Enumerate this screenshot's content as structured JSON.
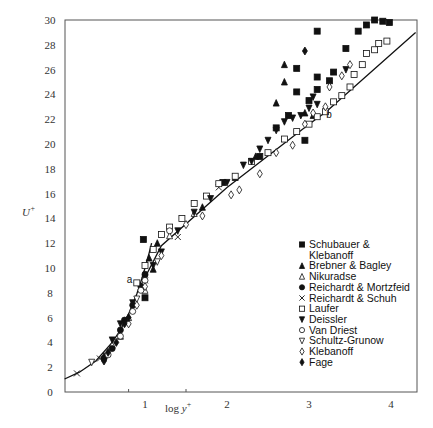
{
  "chart_data": {
    "type": "scatter",
    "title": "",
    "xlabel": "log y+",
    "ylabel": "U+",
    "xlim": [
      0,
      4.3
    ],
    "ylim": [
      0,
      30
    ],
    "xticks": [
      "1",
      "2",
      "3",
      "4"
    ],
    "yticks": [
      "0",
      "2",
      "4",
      "6",
      "8",
      "10",
      "12",
      "14",
      "16",
      "18",
      "20",
      "22",
      "24",
      "26",
      "28",
      "30"
    ],
    "grid": false,
    "legend_position": "lower right inside",
    "annotations": [
      {
        "text": "a",
        "x": 0.9,
        "y": 9.0
      },
      {
        "text": "b",
        "x": 3.21,
        "y": 22.3
      }
    ],
    "curves": [
      {
        "name": "viscous sublayer (U+ = y+)",
        "points": [
          [
            0.02,
            1.05
          ],
          [
            0.2,
            1.6
          ],
          [
            0.4,
            2.5
          ],
          [
            0.6,
            4.0
          ],
          [
            0.7,
            5.0
          ],
          [
            0.8,
            6.3
          ],
          [
            0.9,
            7.9
          ],
          [
            0.95,
            8.9
          ],
          [
            1.0,
            10.0
          ],
          [
            1.05,
            11.2
          ],
          [
            1.08,
            12.0
          ]
        ]
      },
      {
        "name": "log law",
        "points": [
          [
            0.92,
            8.2
          ],
          [
            1.2,
            11.8
          ],
          [
            2.0,
            16.5
          ],
          [
            3.0,
            21.6
          ],
          [
            3.21,
            22.6
          ],
          [
            4.3,
            29.0
          ]
        ]
      }
    ],
    "series": [
      {
        "name": "Schubauer & Klebanoff",
        "marker": "filled-square",
        "points": [
          [
            0.98,
            12.3
          ],
          [
            1.95,
            16.9
          ],
          [
            2.4,
            19.0
          ],
          [
            2.75,
            22.3
          ],
          [
            2.95,
            20.3
          ],
          [
            3.0,
            23.5
          ],
          [
            3.1,
            24.4
          ],
          [
            3.1,
            25.4
          ],
          [
            3.25,
            25.1
          ],
          [
            3.3,
            25.8
          ],
          [
            2.6,
            21.3
          ],
          [
            2.85,
            24.2
          ],
          [
            2.85,
            26.1
          ],
          [
            3.1,
            29.1
          ],
          [
            3.45,
            27.7
          ],
          [
            3.6,
            29.1
          ],
          [
            3.7,
            29.6
          ],
          [
            3.8,
            30.0
          ],
          [
            3.9,
            29.9
          ],
          [
            3.98,
            29.8
          ],
          [
            1.0,
            7.6
          ]
        ]
      },
      {
        "name": "Brebner & Bagley",
        "marker": "filled-triangle-up",
        "points": [
          [
            2.7,
            26.4
          ],
          [
            2.7,
            25.0
          ],
          [
            2.6,
            23.3
          ],
          [
            2.95,
            22.5
          ],
          [
            3.05,
            22.3
          ],
          [
            1.15,
            12.0
          ],
          [
            1.05,
            10.8
          ],
          [
            1.1,
            9.9
          ],
          [
            1.7,
            14.9
          ],
          [
            2.1,
            17.3
          ],
          [
            2.35,
            19.0
          ],
          [
            0.5,
            2.9
          ],
          [
            0.7,
            4.5
          ]
        ]
      },
      {
        "name": "Nikuradse",
        "marker": "open-triangle-up",
        "points": [
          [
            0.6,
            3.8
          ],
          [
            0.8,
            6.0
          ],
          [
            1.0,
            8.2
          ],
          [
            1.3,
            12.6
          ],
          [
            1.6,
            14.4
          ]
        ]
      },
      {
        "name": "Reichardt & Mortzfeid",
        "marker": "filled-circle",
        "points": [
          [
            0.5,
            2.7
          ],
          [
            0.6,
            3.5
          ],
          [
            0.7,
            5.0
          ],
          [
            0.75,
            5.8
          ],
          [
            0.85,
            7.0
          ],
          [
            0.95,
            8.5
          ],
          [
            1.0,
            9.5
          ]
        ]
      },
      {
        "name": "Reichardt & Schuh",
        "marker": "x",
        "points": [
          [
            0.17,
            1.5
          ],
          [
            0.45,
            2.7
          ],
          [
            1.0,
            9.0
          ],
          [
            1.4,
            12.5
          ],
          [
            1.9,
            16.5
          ]
        ]
      },
      {
        "name": "Laufer",
        "marker": "open-square",
        "points": [
          [
            0.9,
            8.8
          ],
          [
            1.0,
            10.2
          ],
          [
            1.1,
            11.5
          ],
          [
            1.2,
            12.7
          ],
          [
            1.3,
            13.3
          ],
          [
            1.45,
            14.0
          ],
          [
            1.6,
            15.2
          ],
          [
            1.75,
            15.8
          ],
          [
            1.9,
            16.8
          ],
          [
            2.1,
            17.4
          ],
          [
            2.3,
            18.6
          ],
          [
            2.5,
            19.3
          ],
          [
            2.7,
            20.4
          ],
          [
            2.85,
            21.0
          ],
          [
            3.0,
            21.6
          ],
          [
            3.1,
            22.2
          ],
          [
            3.2,
            22.6
          ],
          [
            3.3,
            23.4
          ],
          [
            3.4,
            23.9
          ],
          [
            3.5,
            24.6
          ],
          [
            3.55,
            25.6
          ],
          [
            3.65,
            26.4
          ],
          [
            3.7,
            27.3
          ],
          [
            3.8,
            27.6
          ],
          [
            3.85,
            28.1
          ],
          [
            3.95,
            28.3
          ]
        ]
      },
      {
        "name": "Deissler",
        "marker": "filled-triangle-down",
        "points": [
          [
            0.6,
            4.2
          ],
          [
            0.7,
            5.5
          ],
          [
            0.85,
            7.2
          ],
          [
            1.0,
            9.2
          ],
          [
            1.1,
            10.2
          ],
          [
            1.2,
            11.3
          ],
          [
            1.4,
            13.0
          ],
          [
            1.6,
            14.5
          ],
          [
            1.8,
            15.6
          ],
          [
            2.0,
            16.9
          ],
          [
            2.2,
            18.3
          ],
          [
            2.3,
            18.6
          ],
          [
            2.4,
            19.6
          ],
          [
            2.5,
            20.3
          ],
          [
            2.6,
            21.1
          ],
          [
            2.7,
            21.8
          ],
          [
            2.8,
            22.1
          ],
          [
            2.9,
            22.3
          ],
          [
            3.0,
            22.9
          ],
          [
            3.1,
            23.2
          ],
          [
            3.05,
            23.8
          ],
          [
            3.45,
            26.0
          ]
        ]
      },
      {
        "name": "Van Driest",
        "marker": "open-circle",
        "points": [
          [
            0.55,
            3.0
          ],
          [
            0.7,
            4.5
          ],
          [
            0.85,
            6.5
          ],
          [
            0.95,
            8.2
          ],
          [
            1.0,
            9.0
          ],
          [
            1.3,
            13.0
          ]
        ]
      },
      {
        "name": "Schultz-Grunow",
        "marker": "open-triangle-down",
        "points": [
          [
            0.35,
            2.4
          ],
          [
            0.9,
            7.5
          ],
          [
            1.15,
            10.5
          ]
        ]
      },
      {
        "name": "Klebanoff",
        "marker": "open-diamond",
        "points": [
          [
            0.8,
            5.5
          ],
          [
            0.9,
            7.0
          ],
          [
            1.0,
            8.5
          ],
          [
            1.2,
            11.0
          ],
          [
            1.5,
            13.5
          ],
          [
            1.7,
            14.2
          ],
          [
            2.05,
            15.9
          ],
          [
            2.15,
            16.3
          ],
          [
            2.4,
            17.6
          ],
          [
            2.6,
            19.3
          ],
          [
            2.8,
            19.9
          ],
          [
            2.95,
            21.6
          ],
          [
            3.05,
            22.5
          ],
          [
            3.2,
            23.0
          ],
          [
            3.25,
            24.6
          ],
          [
            3.4,
            25.5
          ],
          [
            3.5,
            26.4
          ]
        ]
      },
      {
        "name": "Fage",
        "marker": "filled-diamond",
        "points": [
          [
            0.5,
            2.5
          ],
          [
            0.55,
            3.2
          ],
          [
            0.65,
            4.0
          ],
          [
            0.75,
            5.5
          ],
          [
            0.8,
            6.0
          ],
          [
            2.95,
            27.5
          ]
        ]
      }
    ]
  },
  "legend": {
    "items": [
      {
        "label": "Schubauer &",
        "marker": "filled-square"
      },
      {
        "label": "Klebanoff",
        "marker": "none"
      },
      {
        "label": "Brebner & Bagley",
        "marker": "filled-triangle-up"
      },
      {
        "label": "Nikuradse",
        "marker": "open-triangle-up"
      },
      {
        "label": "Reichardt & Mortzfeid",
        "marker": "filled-circle"
      },
      {
        "label": "Reichardt & Schuh",
        "marker": "x"
      },
      {
        "label": "Laufer",
        "marker": "open-square"
      },
      {
        "label": "Deissler",
        "marker": "filled-triangle-down"
      },
      {
        "label": "Van Driest",
        "marker": "open-circle"
      },
      {
        "label": "Schultz-Grunow",
        "marker": "open-triangle-down"
      },
      {
        "label": "Klebanoff",
        "marker": "open-diamond"
      },
      {
        "label": "Fage",
        "marker": "filled-diamond"
      }
    ]
  },
  "axes": {
    "xlabel": "log y",
    "xlabel_sup": "+",
    "ylabel": "U",
    "ylabel_sup": "+"
  },
  "colors": {
    "ink": "#111111",
    "frame": "#555555",
    "background": "#ffffff"
  }
}
